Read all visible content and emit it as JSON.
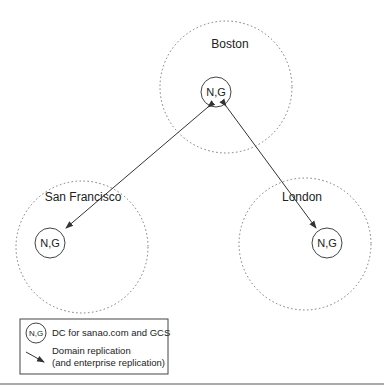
{
  "sites": [
    {
      "name": "Boston",
      "node": "N,G"
    },
    {
      "name": "San Francisco",
      "node": "N,G"
    },
    {
      "name": "London",
      "node": "N,G"
    }
  ],
  "legend": {
    "node_symbol": "N,G",
    "node_desc": "DC for sanao.com and GCS",
    "arrow_desc_1": "Domain replication",
    "arrow_desc_2": "(and enterprise replication)"
  }
}
